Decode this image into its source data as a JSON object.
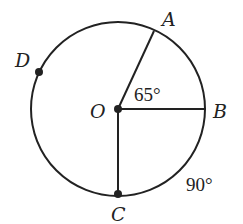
{
  "diagram": {
    "title": "",
    "points": {
      "O": {
        "label": "O",
        "x": 118,
        "y": 109
      },
      "A": {
        "label": "A",
        "x": 154,
        "y": 31
      },
      "B": {
        "label": "B",
        "x": 206,
        "y": 109
      },
      "C": {
        "label": "C",
        "x": 118,
        "y": 194
      },
      "D": {
        "label": "D",
        "x": 39,
        "y": 72
      }
    },
    "circle": {
      "cx": 118,
      "cy": 109,
      "r": 88
    },
    "angles": {
      "AOB": "65°",
      "arc_BC": "90°"
    },
    "stroke_color": "#222222"
  }
}
